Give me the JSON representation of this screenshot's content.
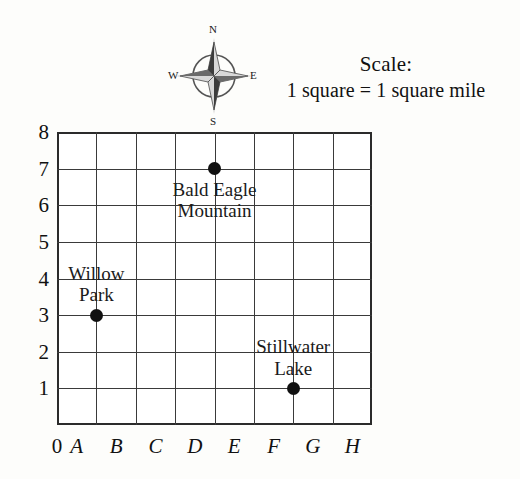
{
  "compass": {
    "name": "compass-rose",
    "north": "N",
    "south": "S",
    "west": "W",
    "east": "E"
  },
  "scale": {
    "title": "Scale:",
    "text": "1 square = 1 square mile"
  },
  "map": {
    "grid": {
      "columns": 8,
      "rows": 8,
      "line_color": "#3a3a3a",
      "border_color": "#2b2b2b",
      "background": "#ffffff"
    },
    "x_axis": {
      "origin": "0",
      "labels": [
        "A",
        "B",
        "C",
        "D",
        "E",
        "F",
        "G",
        "H"
      ]
    },
    "y_axis": {
      "labels": [
        "8",
        "7",
        "6",
        "5",
        "4",
        "3",
        "2",
        "1"
      ]
    },
    "points": [
      {
        "name": "bald-eagle-mountain",
        "label_line1": "Bald Eagle",
        "label_line2": "Mountain",
        "x": "D",
        "y": "7",
        "dot_color": "#111111"
      },
      {
        "name": "willow-park",
        "label_line1": "Willow",
        "label_line2": "Park",
        "x": "A",
        "y": "3",
        "dot_color": "#111111"
      },
      {
        "name": "stillwater-lake",
        "label_line1": "Stillwater",
        "label_line2": "Lake",
        "x": "F",
        "y": "1",
        "dot_color": "#111111"
      }
    ]
  }
}
